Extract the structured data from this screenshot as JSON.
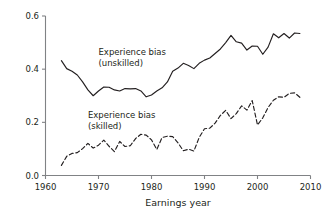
{
  "figure": {
    "background_color": "#ffffff",
    "line_color": "#231f20",
    "axis_color": "#808285"
  },
  "chart_data": {
    "type": "line",
    "title": "",
    "subtitle": "",
    "xlabel": "Earnings year",
    "ylabel": "",
    "xlim": [
      1960,
      2010
    ],
    "ylim": [
      0.0,
      0.6
    ],
    "xticks": [
      1960,
      1970,
      1980,
      1990,
      2000,
      2010
    ],
    "xticklabels": [
      "1960",
      "1970",
      "1980",
      "1990",
      "2000",
      "2010"
    ],
    "yticks": [
      0.0,
      0.2,
      0.4,
      0.6
    ],
    "yticklabels": [
      "0.0",
      "0.2",
      "0.4",
      "0.6"
    ],
    "grid": false,
    "legend_position": "inline-annotations",
    "annotations": [
      {
        "name": "unskilled-label",
        "lines": [
          "Experience bias",
          "(unskilled)"
        ],
        "x": 1970.0,
        "y": 0.455
      },
      {
        "name": "skilled-label",
        "lines": [
          "Experience bias",
          "(skilled)"
        ],
        "x": 1968.0,
        "y": 0.215
      }
    ],
    "series": [
      {
        "name": "Experience bias (unskilled)",
        "style": "solid",
        "color": "#231f20",
        "x": [
          1963,
          1964,
          1965,
          1966,
          1967,
          1968,
          1969,
          1970,
          1971,
          1972,
          1973,
          1974,
          1975,
          1976,
          1977,
          1978,
          1979,
          1980,
          1981,
          1982,
          1983,
          1984,
          1985,
          1986,
          1987,
          1988,
          1989,
          1990,
          1991,
          1992,
          1993,
          1994,
          1995,
          1996,
          1997,
          1998,
          1999,
          2000,
          2001,
          2002,
          2003,
          2004,
          2005,
          2006,
          2007,
          2008
        ],
        "values": [
          0.432,
          0.402,
          0.392,
          0.378,
          0.352,
          0.322,
          0.3,
          0.318,
          0.333,
          0.332,
          0.322,
          0.318,
          0.327,
          0.326,
          0.327,
          0.318,
          0.296,
          0.303,
          0.318,
          0.33,
          0.352,
          0.392,
          0.404,
          0.422,
          0.414,
          0.402,
          0.422,
          0.434,
          0.442,
          0.459,
          0.476,
          0.5,
          0.527,
          0.503,
          0.498,
          0.472,
          0.487,
          0.486,
          0.456,
          0.483,
          0.533,
          0.518,
          0.534,
          0.517,
          0.536,
          0.534
        ]
      },
      {
        "name": "Experience bias (skilled)",
        "style": "dashed",
        "color": "#231f20",
        "x": [
          1963,
          1964,
          1965,
          1966,
          1967,
          1968,
          1969,
          1970,
          1971,
          1972,
          1973,
          1974,
          1975,
          1976,
          1977,
          1978,
          1979,
          1980,
          1981,
          1982,
          1983,
          1984,
          1985,
          1986,
          1987,
          1988,
          1989,
          1990,
          1991,
          1992,
          1993,
          1994,
          1995,
          1996,
          1997,
          1998,
          1999,
          2000,
          2001,
          2002,
          2003,
          2004,
          2005,
          2006,
          2007,
          2008
        ],
        "values": [
          0.038,
          0.072,
          0.083,
          0.086,
          0.101,
          0.121,
          0.103,
          0.114,
          0.133,
          0.11,
          0.09,
          0.128,
          0.109,
          0.112,
          0.139,
          0.155,
          0.152,
          0.134,
          0.098,
          0.143,
          0.148,
          0.146,
          0.123,
          0.093,
          0.099,
          0.092,
          0.143,
          0.176,
          0.178,
          0.197,
          0.226,
          0.245,
          0.214,
          0.233,
          0.262,
          0.246,
          0.282,
          0.19,
          0.217,
          0.256,
          0.283,
          0.296,
          0.294,
          0.309,
          0.311,
          0.294
        ]
      }
    ]
  }
}
